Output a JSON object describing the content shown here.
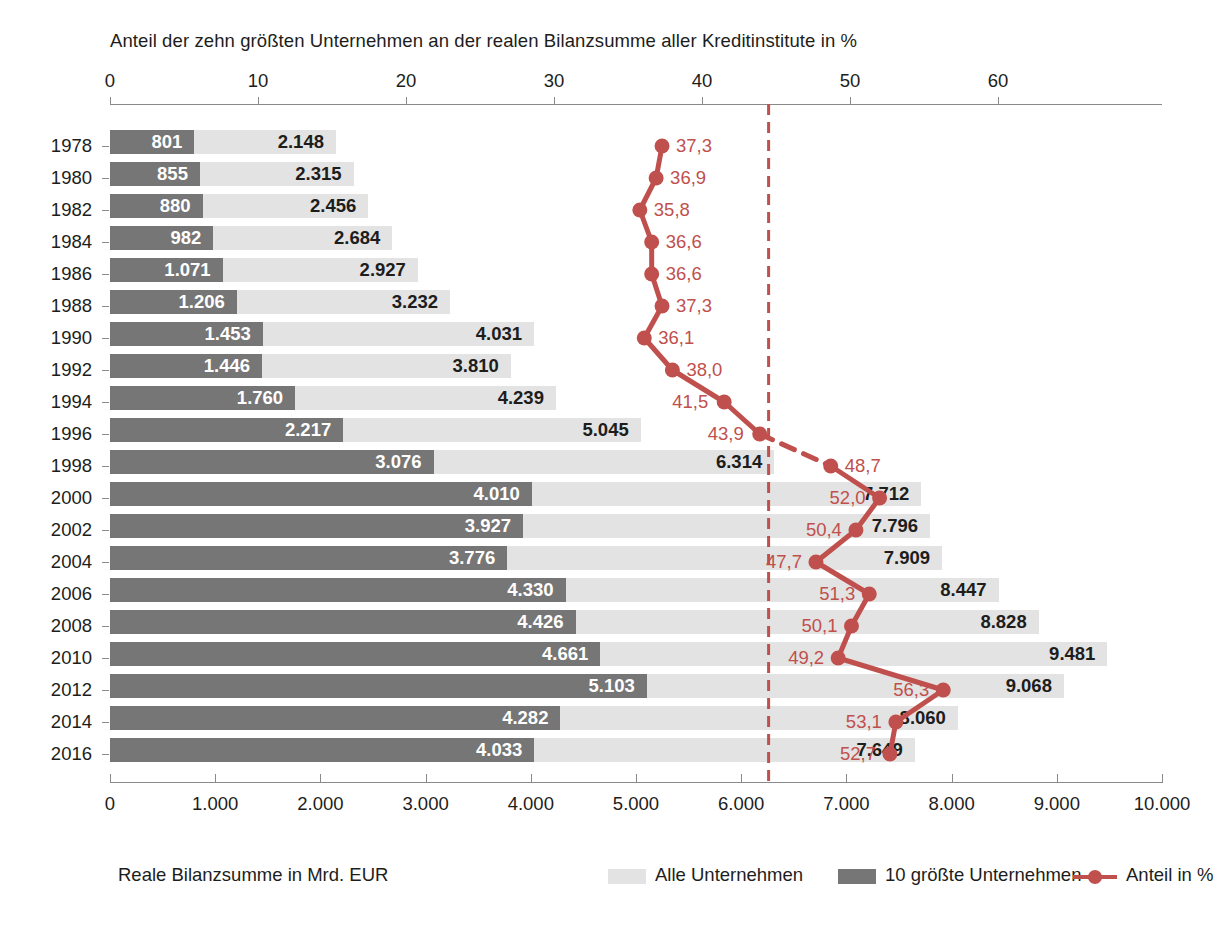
{
  "chart_data": {
    "type": "bar",
    "title": "Anteil der zehn größten Unternehmen an der realen Bilanzsumme aller Kreditinstitute in %",
    "subtitle": "",
    "orientation": "horizontal",
    "xlabel_bottom": "Reale Bilanzsumme in Mrd. EUR",
    "xlabel_top": "Anteil der zehn größten Unternehmen an der realen Bilanzsumme aller Kreditinstitute in %",
    "grid": false,
    "legend_position": "bottom",
    "top_axis": {
      "label": "Anteil in %",
      "ticks": [
        "0",
        "10",
        "20",
        "30",
        "40",
        "50",
        "60"
      ],
      "values": [
        0,
        10,
        20,
        30,
        40,
        50,
        60
      ],
      "range": [
        0,
        70
      ]
    },
    "bottom_axis": {
      "label": "Reale Bilanzsumme in Mrd. EUR",
      "ticks": [
        "0",
        "1.000",
        "2.000",
        "3.000",
        "4.000",
        "5.000",
        "6.000",
        "7.000",
        "8.000",
        "9.000",
        "10.000"
      ],
      "values": [
        0,
        1000,
        2000,
        3000,
        4000,
        5000,
        6000,
        7000,
        8000,
        9000,
        10000
      ],
      "range": [
        0,
        10000
      ]
    },
    "categories": [
      "1978",
      "1980",
      "1982",
      "1984",
      "1986",
      "1988",
      "1990",
      "1992",
      "1994",
      "1996",
      "1998",
      "2000",
      "2002",
      "2004",
      "2006",
      "2008",
      "2010",
      "2012",
      "2014",
      "2016"
    ],
    "series": [
      {
        "name": "Alle Unternehmen",
        "color": "#e3e3e3",
        "unit": "Mrd. EUR",
        "values": [
          2148,
          2315,
          2456,
          2684,
          2927,
          3232,
          4031,
          3810,
          4239,
          5045,
          6314,
          7712,
          7796,
          7909,
          8447,
          8828,
          9481,
          9068,
          8060,
          7649
        ],
        "labels": [
          "2.148",
          "2.315",
          "2.456",
          "2.684",
          "2.927",
          "3.232",
          "4.031",
          "3.810",
          "4.239",
          "5.045",
          "6.314",
          "7.712",
          "7.796",
          "7.909",
          "8.447",
          "8.828",
          "9.481",
          "9.068",
          "8.060",
          "7.649"
        ]
      },
      {
        "name": "10 größte Unternehmen",
        "color": "#767676",
        "unit": "Mrd. EUR",
        "values": [
          801,
          855,
          880,
          982,
          1071,
          1206,
          1453,
          1446,
          1760,
          2217,
          3076,
          4010,
          3927,
          3776,
          4330,
          4426,
          4661,
          5103,
          4282,
          4033
        ],
        "labels": [
          "801",
          "855",
          "880",
          "982",
          "1.071",
          "1.206",
          "1.453",
          "1.446",
          "1.760",
          "2.217",
          "3.076",
          "4.010",
          "3.927",
          "3.776",
          "4.330",
          "4.426",
          "4.661",
          "5.103",
          "4.282",
          "4.033"
        ]
      },
      {
        "name": "Anteil in %",
        "color": "#c0504d",
        "unit": "%",
        "values": [
          37.3,
          36.9,
          35.8,
          36.6,
          36.6,
          37.3,
          36.1,
          38.0,
          41.5,
          43.9,
          48.7,
          52.0,
          50.4,
          47.7,
          51.3,
          50.1,
          49.2,
          56.3,
          53.1,
          52.7
        ],
        "labels": [
          "37,3",
          "36,9",
          "35,8",
          "36,6",
          "36,6",
          "37,3",
          "36,1",
          "38,0",
          "41,5",
          "43,9",
          "48,7",
          "52,0",
          "50,4",
          "47,7",
          "51,3",
          "50,1",
          "49,2",
          "56,3",
          "53,1",
          "52,7"
        ],
        "dashed_segment_between": [
          "1996",
          "1998"
        ]
      }
    ],
    "annotations": [
      {
        "type": "vertical-reference-line",
        "style": "dashed",
        "color": "#c0504d",
        "value_top_axis": 44.5,
        "value_bottom_axis": 5940
      }
    ]
  },
  "legend": {
    "axis_title": "Reale Bilanzsumme in Mrd. EUR",
    "items": [
      {
        "label": "Alle Unternehmen",
        "swatch": "light-gray-swatch"
      },
      {
        "label": "10 größte Unternehmen",
        "swatch": "dark-gray-swatch"
      },
      {
        "label": "Anteil in %",
        "swatch": "red-line-marker"
      }
    ]
  }
}
